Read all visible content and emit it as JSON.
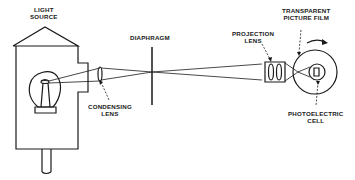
{
  "diagram": {
    "labels": {
      "light_source": [
        "LIGHT",
        "SOURCE"
      ],
      "condensing_lens": [
        "CONDENSING",
        "LENS"
      ],
      "diaphragm": [
        "DIAPHRAGM"
      ],
      "projection_lens": [
        "PROJECTION",
        "LENS"
      ],
      "film": [
        "TRANSPARENT",
        "PICTURE FILM"
      ],
      "photocell": [
        "PHOTOELECTRIC",
        "CELL"
      ]
    },
    "colors": {
      "ink": "#1a1a1a",
      "background": "#ffffff"
    }
  }
}
